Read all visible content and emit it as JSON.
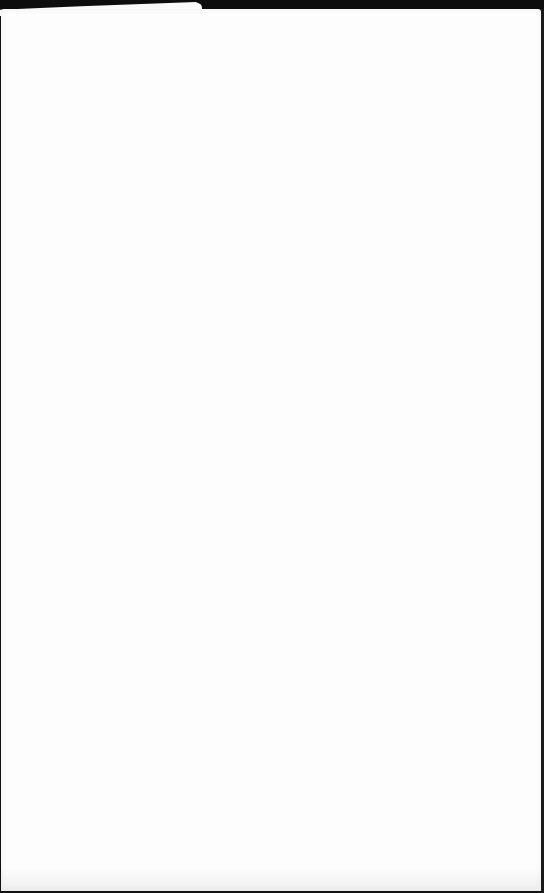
{
  "page": {
    "background": "#fdfdfd",
    "frame_color": "#0d0d0d",
    "content_text": ""
  }
}
